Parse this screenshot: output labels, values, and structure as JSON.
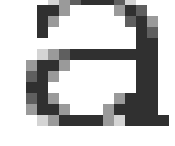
{
  "glyph": {
    "character": "a",
    "cell_size": 11,
    "origin": {
      "x": 15,
      "y": -6
    },
    "shades": {
      "D": "#303030",
      "M": "#5f5f5f",
      "L": "#9a9a9a",
      "X": "#d4d4d4"
    },
    "rows": [
      "...XLMDDDMX.....",
      "..DDL....LDM....",
      "..DL......MDL...",
      "..D........DM...",
      "...........DD...",
      "..XLMDDDDDDDD...",
      ".LDDL......DD...",
      ".MDL.......DD...",
      ".DD........DD...",
      ".MDL.....LDDD...",
      ".LDDL...LDDDD...",
      "..XLDDDDLXDDDD..",
      "................"
    ]
  }
}
